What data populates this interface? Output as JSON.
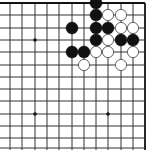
{
  "board": {
    "game": "Go",
    "view": "top-right corner diagram",
    "colors": {
      "background": "#ffffff",
      "line": "#333333",
      "edge": "#111111",
      "black_stone": "#111111",
      "white_stone": "#ffffff",
      "white_outline": "#555555"
    },
    "grid": {
      "x": [
        10,
        22,
        35,
        47,
        59,
        72,
        84,
        96,
        108,
        121,
        133,
        145
      ],
      "y": [
        3,
        15,
        28,
        40,
        52,
        65,
        77,
        89,
        101,
        114,
        126,
        138,
        148
      ]
    },
    "edges": [
      "top",
      "right"
    ],
    "star_points": [
      [
        35,
        40
      ],
      [
        35,
        114
      ],
      [
        108,
        114
      ]
    ],
    "stones": [
      {
        "color": "black",
        "col": 7,
        "row": 0
      },
      {
        "color": "black",
        "col": 7,
        "row": 1
      },
      {
        "color": "white",
        "col": 8,
        "row": 1
      },
      {
        "color": "white",
        "col": 9,
        "row": 1
      },
      {
        "color": "black",
        "col": 5,
        "row": 2
      },
      {
        "color": "black",
        "col": 7,
        "row": 2
      },
      {
        "color": "black",
        "col": 8,
        "row": 2
      },
      {
        "color": "white",
        "col": 9,
        "row": 2
      },
      {
        "color": "white",
        "col": 10,
        "row": 2
      },
      {
        "color": "black",
        "col": 7,
        "row": 3
      },
      {
        "color": "white",
        "col": 8,
        "row": 3
      },
      {
        "color": "black",
        "col": 9,
        "row": 3
      },
      {
        "color": "black",
        "col": 10,
        "row": 3
      },
      {
        "color": "black",
        "col": 5,
        "row": 4
      },
      {
        "color": "black",
        "col": 6,
        "row": 4
      },
      {
        "color": "white",
        "col": 7,
        "row": 4
      },
      {
        "color": "white",
        "col": 8,
        "row": 4
      },
      {
        "color": "white",
        "col": 10,
        "row": 4
      },
      {
        "color": "white",
        "col": 6,
        "row": 5
      },
      {
        "color": "white",
        "col": 9,
        "row": 5
      }
    ]
  }
}
